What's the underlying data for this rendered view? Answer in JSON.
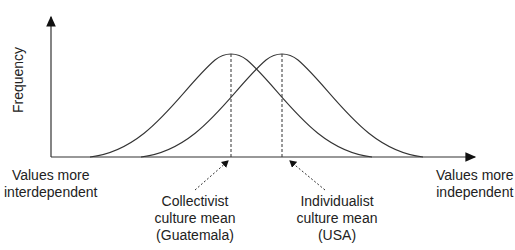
{
  "diagram": {
    "type": "two-normal-distributions",
    "y_axis_label": "Frequency",
    "x_axis_left_label": [
      "Values more",
      "interdependent"
    ],
    "x_axis_right_label": [
      "Values more",
      "independent"
    ],
    "curves": [
      {
        "name": "Collectivist",
        "mean_x": 231,
        "annotation": [
          "Collectivist",
          "culture mean",
          "(Guatemala)"
        ]
      },
      {
        "name": "Individualist",
        "mean_x": 282,
        "annotation": [
          "Individualist",
          "culture mean",
          "(USA)"
        ]
      }
    ],
    "line_color": "#333333"
  }
}
